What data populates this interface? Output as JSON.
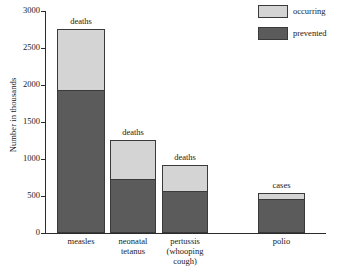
{
  "chart_data": {
    "type": "bar",
    "title": "",
    "subtitle": "",
    "xlabel": "",
    "ylabel": "Number in thousands",
    "ylim": [
      0,
      3000
    ],
    "ytick_labels": [
      "0",
      "500",
      "1000",
      "1500",
      "2000",
      "2500",
      "3000"
    ],
    "ytick_values": [
      0,
      500,
      1000,
      1500,
      2000,
      2500,
      3000
    ],
    "grid": false,
    "stacked": true,
    "legend_position": "top-right",
    "categories": [
      "measles",
      "neonatal tetanus",
      "pertussis (whooping cough)",
      "polio"
    ],
    "category_label_lines": [
      "measles",
      "neonatal\ntetanus",
      "pertussis\n(whooping\ncough)",
      "polio"
    ],
    "bar_annotations": [
      "deaths",
      "deaths",
      "deaths",
      "cases"
    ],
    "series": [
      {
        "name": "prevented",
        "color": "#5b5b5b",
        "values": [
          1920,
          720,
          560,
          450
        ]
      },
      {
        "name": "occurring",
        "color": "#d4d4d4",
        "values": [
          840,
          540,
          355,
          90
        ]
      }
    ],
    "totals": [
      2760,
      1260,
      915,
      540
    ]
  },
  "legend": {
    "items": [
      {
        "label": "occurring",
        "swatch": "occurring"
      },
      {
        "label": "prevented",
        "swatch": "prevented"
      }
    ]
  },
  "axis": {
    "y_title": "Number in thousands",
    "y_ticks": [
      "3000",
      "2500",
      "2000",
      "1500",
      "1000",
      "500",
      "0"
    ]
  },
  "colors": {
    "occurring": "#d4d4d4",
    "prevented": "#5b5b5b",
    "axis": "#2b2b2b",
    "outline": "#3a3a3a",
    "background": "#ffffff"
  }
}
